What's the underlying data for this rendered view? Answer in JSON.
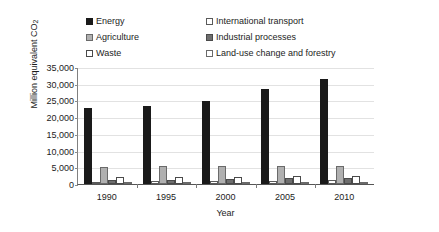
{
  "chart_data": {
    "type": "bar",
    "title": "",
    "xlabel": "Year",
    "ylabel_main": "Million equivalent CO",
    "ylabel_sub": "2",
    "categories": [
      "1990",
      "1995",
      "2000",
      "2005",
      "2010"
    ],
    "ylim": [
      0,
      35000
    ],
    "ytick_labels": [
      "35,000",
      "30,000",
      "25,000",
      "20,000",
      "15,000",
      "10,000",
      "5,000",
      "0"
    ],
    "ytick_values": [
      35000,
      30000,
      25000,
      20000,
      15000,
      10000,
      5000,
      0
    ],
    "grid": true,
    "legend_position": "top",
    "series": [
      {
        "name": "Energy",
        "color": "#1a1a1a",
        "border": "#1a1a1a",
        "values": [
          22800,
          23300,
          24700,
          28300,
          31500
        ]
      },
      {
        "name": "International transport",
        "color": "#ffffff",
        "border": "#5a5a5a",
        "values": [
          700,
          800,
          900,
          1000,
          1100
        ]
      },
      {
        "name": "Agriculture",
        "color": "#b0b0b0",
        "border": "#6a6a6a",
        "values": [
          5200,
          5300,
          5300,
          5400,
          5500
        ]
      },
      {
        "name": "Industrial processes",
        "color": "#6e6e6e",
        "border": "#4a4a4a",
        "values": [
          1300,
          1300,
          1500,
          1700,
          1800
        ]
      },
      {
        "name": "Waste",
        "color": "#ffffff",
        "border": "#4a4a4a",
        "values": [
          2000,
          2100,
          2200,
          2300,
          2400
        ]
      },
      {
        "name": "Land-use change and forestry",
        "color": "#ffffff",
        "border": "#6a6a6a",
        "values": [
          350,
          350,
          350,
          350,
          350
        ]
      }
    ],
    "legend_order": [
      "Energy",
      "International transport",
      "Agriculture",
      "Industrial processes",
      "Waste",
      "Land-use change and forestry"
    ]
  }
}
